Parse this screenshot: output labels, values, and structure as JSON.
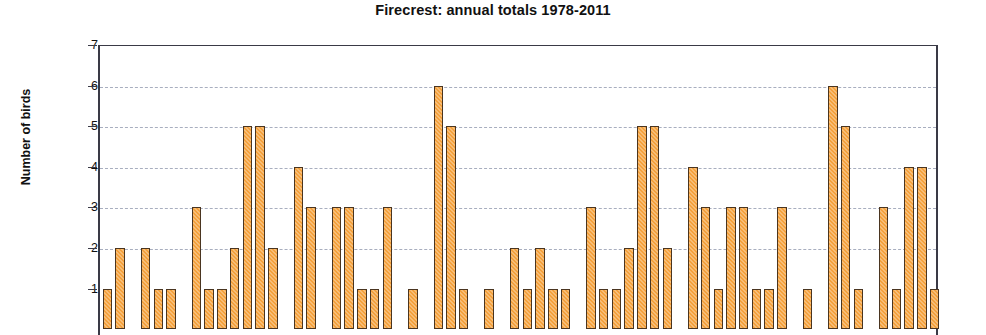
{
  "chart_data": {
    "type": "bar",
    "title": "Firecrest: annual totals 1978-2011",
    "xlabel": "",
    "ylabel": "Number of birds",
    "ylim": [
      0,
      7
    ],
    "yticks": [
      1,
      2,
      3,
      4,
      5,
      6,
      7
    ],
    "ytick_labels": [
      "1",
      "2",
      "3",
      "4",
      "5",
      "6",
      "7"
    ],
    "grid": true,
    "gridlines_at": [
      2,
      3,
      4,
      5,
      6
    ],
    "legend": null,
    "bar_color": "#f4a13c",
    "bar_edge_color": "#4a3520",
    "axis_color": "#3a3a46",
    "gridline_color": "#9aa0b4",
    "note": "x-axis category labels are cropped out of the visible image",
    "values": [
      1,
      2,
      0,
      2,
      1,
      1,
      0,
      3,
      1,
      1,
      2,
      5,
      5,
      2,
      0,
      4,
      3,
      0,
      3,
      3,
      1,
      1,
      3,
      0,
      1,
      0,
      6,
      5,
      1,
      0,
      1,
      0,
      2,
      1,
      2,
      1,
      1,
      0,
      3,
      1,
      1,
      2,
      5,
      5,
      2,
      0,
      4,
      3,
      1,
      3,
      3,
      1,
      1,
      3,
      0,
      1,
      0,
      6,
      5,
      1,
      0,
      3,
      1,
      4,
      4,
      1
    ]
  },
  "axis": {
    "y_title": "Number of birds"
  }
}
